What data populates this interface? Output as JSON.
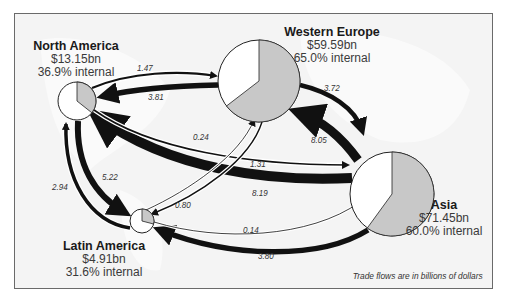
{
  "diagram": {
    "type": "trade-flow-map",
    "note": "Trade flows are in billions of dollars",
    "colors": {
      "external": "#ffffff",
      "internal": "#c8c8c8",
      "arrow": "#111111",
      "background": "#f4f4f4",
      "border": "#6a6a6a"
    },
    "regions": [
      {
        "id": "north_america",
        "name": "North America",
        "total": "$13.15bn",
        "internal": "36.9% internal",
        "internal_pct": 36.9
      },
      {
        "id": "western_europe",
        "name": "Western Europe",
        "total": "$59.59bn",
        "internal": "65.0% internal",
        "internal_pct": 65.0
      },
      {
        "id": "asia",
        "name": "Asia",
        "total": "$71.45bn",
        "internal": "60.0% internal",
        "internal_pct": 60.0
      },
      {
        "id": "latin_america",
        "name": "Latin America",
        "total": "$4.91bn",
        "internal": "31.6% internal",
        "internal_pct": 31.6
      }
    ],
    "flows": [
      {
        "from": "North America",
        "to": "Western Europe",
        "value": "1.47"
      },
      {
        "from": "Western Europe",
        "to": "North America",
        "value": "3.81"
      },
      {
        "from": "Western Europe",
        "to": "Asia",
        "value": "3.72"
      },
      {
        "from": "Asia",
        "to": "Western Europe",
        "value": "8.05"
      },
      {
        "from": "North America",
        "to": "Asia",
        "value": "1.31"
      },
      {
        "from": "Asia",
        "to": "North America",
        "value": "8.19"
      },
      {
        "from": "Latin America",
        "to": "Western Europe",
        "value": "0.24"
      },
      {
        "from": "Western Europe",
        "to": "Latin America",
        "value": "0.80"
      },
      {
        "from": "Latin America",
        "to": "North America",
        "value": "2.94"
      },
      {
        "from": "North America",
        "to": "Latin America",
        "value": "5.22"
      },
      {
        "from": "Latin America",
        "to": "Asia",
        "value": "0.14"
      },
      {
        "from": "Asia",
        "to": "Latin America",
        "value": "3.80"
      }
    ]
  }
}
